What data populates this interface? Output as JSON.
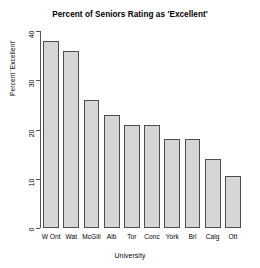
{
  "chart_data": {
    "type": "bar",
    "title": "Percent of Seniors Rating as 'Excellent'",
    "xlabel": "University",
    "ylabel": "Percent 'Excellent'",
    "categories": [
      "W Ont",
      "Wat",
      "McGill",
      "Alb",
      "Tor",
      "Conc",
      "York",
      "Bri",
      "Calg",
      "Ott"
    ],
    "values": [
      38,
      36,
      26,
      23,
      21,
      21,
      18,
      18,
      14,
      10.5
    ],
    "ylim": [
      0,
      40
    ],
    "yticks": [
      0,
      10,
      20,
      30,
      40
    ],
    "ytick_labels": [
      "0",
      "10",
      "20",
      "30",
      "40"
    ],
    "grid": false,
    "legend": null,
    "bar_fill_color": "#d6d6d6",
    "bar_border_color": "#4d4d4d",
    "axis_color": "#555555",
    "background_color": "#ffffff"
  }
}
